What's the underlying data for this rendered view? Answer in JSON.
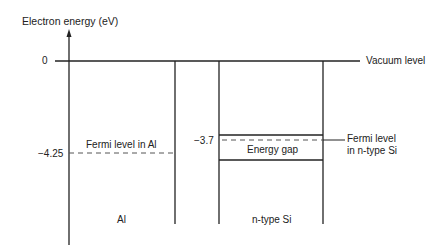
{
  "diagram": {
    "y_axis_label": "Electron energy (eV)",
    "tick_zero": "0",
    "tick_al_fermi": "−4.25",
    "tick_si_fermi": "−3.7",
    "vacuum_label": "Vacuum level",
    "fermi_al_label": "Fermi level in Al",
    "fermi_si_label_line1": "Fermi level",
    "fermi_si_label_line2": "in n-type Si",
    "energy_gap_label": "Energy gap",
    "al_label": "Al",
    "si_label": "n-type Si"
  }
}
